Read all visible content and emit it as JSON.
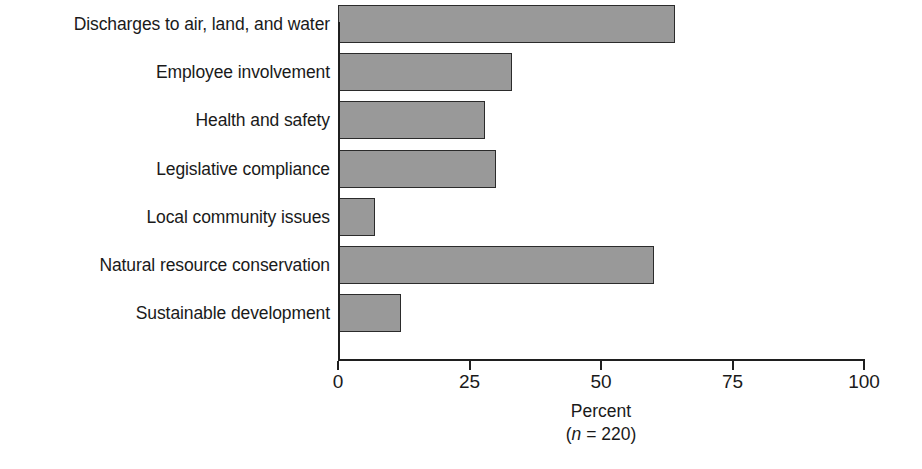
{
  "chart_data": {
    "type": "bar",
    "orientation": "horizontal",
    "title": "",
    "xlabel": "Percent",
    "xlabel_note": "(n = 220)",
    "sample_size_prefix": "(",
    "sample_size_var": "n",
    "sample_size_eq": " = 220)",
    "ylabel": "",
    "xlim": [
      0,
      100
    ],
    "xticks": [
      0,
      25,
      50,
      75,
      100
    ],
    "xtick_labels": [
      "0",
      "25",
      "50",
      "75",
      "100"
    ],
    "grid": false,
    "legend": false,
    "bar_color": "#999999",
    "bar_border_color": "#2b2b2b",
    "axis_color": "#1f1f1f",
    "categories": [
      "Discharges to air, land, and water",
      "Employee involvement",
      "Health and safety",
      "Legislative compliance",
      "Local community issues",
      "Natural resource conservation",
      "Sustainable development"
    ],
    "values": [
      64,
      33,
      28,
      30,
      7,
      60,
      12
    ],
    "series": [
      {
        "name": "Percent",
        "values": [
          64,
          33,
          28,
          30,
          7,
          60,
          12
        ]
      }
    ]
  }
}
